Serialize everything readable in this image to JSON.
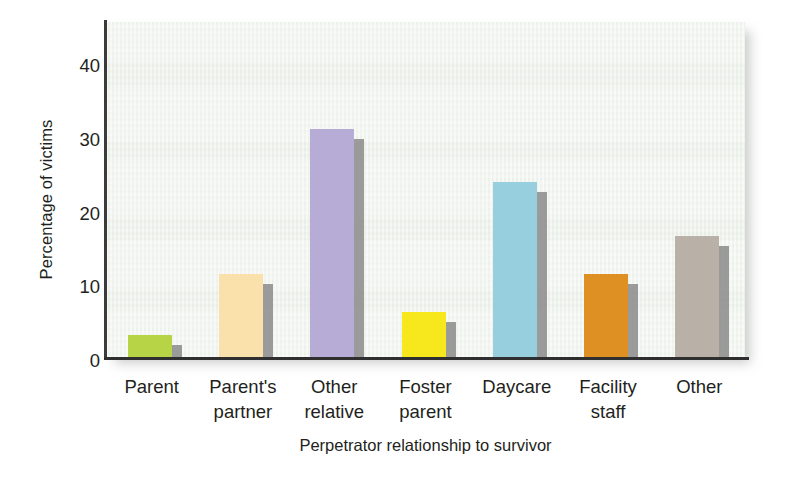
{
  "chart_data": {
    "type": "bar",
    "title": "",
    "xlabel": "Perpetrator relationship to survivor",
    "ylabel": "Percentage of victims",
    "categories": [
      "Parent",
      "Parent's partner",
      "Other relative",
      "Foster parent",
      "Daycare",
      "Facility staff",
      "Other"
    ],
    "category_lines": [
      [
        "Parent",
        ""
      ],
      [
        "Parent's",
        "partner"
      ],
      [
        "Other",
        "relative"
      ],
      [
        "Foster",
        "parent"
      ],
      [
        "Daycare",
        ""
      ],
      [
        "Facility",
        "staff"
      ],
      [
        "Other",
        ""
      ]
    ],
    "values": [
      3,
      11,
      30,
      6,
      23,
      11,
      16
    ],
    "bar_colors": [
      "#b7d346",
      "#fae1ab",
      "#b6acd5",
      "#f7e81e",
      "#97cfdf",
      "#de9023",
      "#b9b1a7"
    ],
    "shadow_color": "#8d8d8d",
    "ylim": [
      0,
      44
    ],
    "yticks": [
      0,
      10,
      20,
      30,
      40
    ],
    "ytick_labels": [
      "0",
      "10",
      "20",
      "30",
      "40"
    ],
    "grid": false,
    "legend": "none",
    "panel_background": "#f1f4ef",
    "axis_color": "#2f2f2f"
  }
}
